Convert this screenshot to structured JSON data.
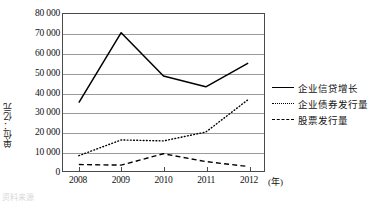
{
  "chart_data": {
    "type": "line",
    "title": "",
    "xlabel": "(年)",
    "ylabel": "单位：亿元",
    "categories": [
      "2008",
      "2009",
      "2010",
      "2011",
      "2012"
    ],
    "x": [
      2008,
      2009,
      2010,
      2011,
      2012
    ],
    "ylim": [
      0,
      80000
    ],
    "ytick_values": [
      0,
      10000,
      20000,
      30000,
      40000,
      50000,
      60000,
      70000,
      80000
    ],
    "ytick_labels": [
      "0",
      "10 000",
      "20 000",
      "30 000",
      "40 000",
      "50 000",
      "60 000",
      "70 000",
      "80 000"
    ],
    "grid": true,
    "legend_position": "right",
    "series": [
      {
        "name": "企业信贷增长",
        "style": "solid",
        "color": "#000000",
        "values": [
          35000,
          70500,
          48500,
          43000,
          55000
        ]
      },
      {
        "name": "企业债券发行量",
        "style": "dotted",
        "color": "#000000",
        "values": [
          8000,
          16000,
          15500,
          20000,
          36500
        ]
      },
      {
        "name": "股票发行量",
        "style": "dashed",
        "color": "#000000",
        "values": [
          3500,
          3200,
          9000,
          5000,
          2500
        ]
      }
    ]
  },
  "axis": {
    "y_unit_label": "单位：亿元",
    "x_unit_label": "(年)"
  },
  "legend": {
    "items": [
      {
        "label": "企业信贷增长",
        "style": "solid"
      },
      {
        "label": "企业债券发行量",
        "style": "dotted"
      },
      {
        "label": "股票发行量",
        "style": "dashed"
      }
    ]
  },
  "caption": {
    "text": "资料来源"
  }
}
